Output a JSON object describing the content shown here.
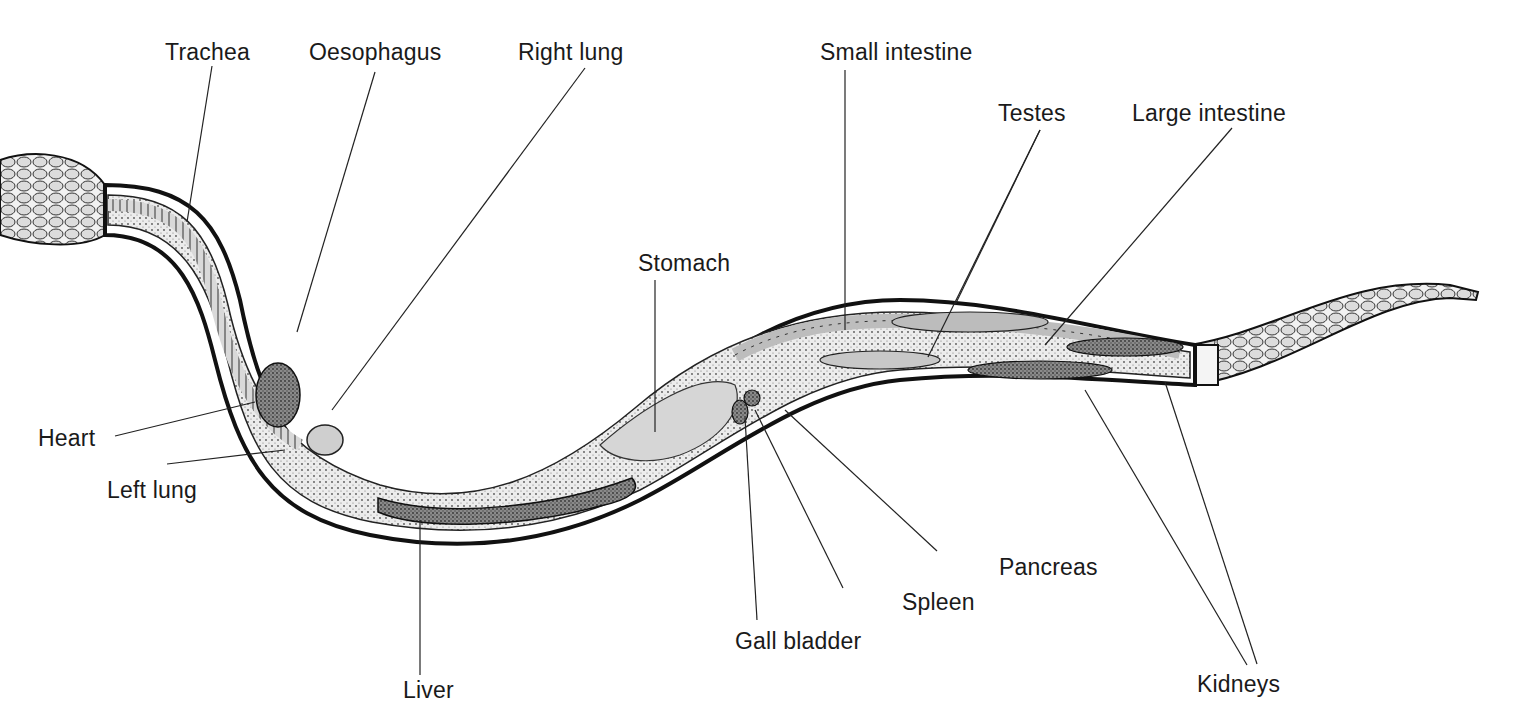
{
  "diagram": {
    "colors": {
      "outline": "#111111",
      "body_fill": "#e6e6e6",
      "organ_dark": "#6e6e6e",
      "organ_mid": "#b5b5b5",
      "leader": "#222222"
    },
    "labels": [
      {
        "id": "trachea",
        "text": "Trachea",
        "x": 165,
        "y": 41,
        "line": [
          212,
          66,
          187,
          222
        ]
      },
      {
        "id": "oesophagus",
        "text": "Oesophagus",
        "x": 309,
        "y": 41,
        "line": [
          375,
          72,
          297,
          332
        ]
      },
      {
        "id": "right-lung",
        "text": "Right lung",
        "x": 518,
        "y": 41,
        "line": [
          585,
          68,
          332,
          410
        ]
      },
      {
        "id": "small-intestine",
        "text": "Small intestine",
        "x": 820,
        "y": 41,
        "line": [
          845,
          70,
          845,
          330
        ]
      },
      {
        "id": "testes",
        "text": "Testes",
        "x": 998,
        "y": 102,
        "line": [
          1040,
          130,
          928,
          357
        ],
        "line2": [
          1040,
          130,
          955,
          305
        ]
      },
      {
        "id": "large-intestine",
        "text": "Large intestine",
        "x": 1132,
        "y": 102,
        "line": [
          1232,
          128,
          1045,
          345
        ]
      },
      {
        "id": "stomach",
        "text": "Stomach",
        "x": 638,
        "y": 252,
        "line": [
          655,
          280,
          655,
          432
        ]
      },
      {
        "id": "heart",
        "text": "Heart",
        "x": 38,
        "y": 427,
        "line": [
          115,
          436,
          255,
          402
        ]
      },
      {
        "id": "left-lung",
        "text": "Left lung",
        "x": 107,
        "y": 479,
        "line": [
          167,
          464,
          285,
          450
        ]
      },
      {
        "id": "liver",
        "text": "Liver",
        "x": 403,
        "y": 679,
        "line": [
          420,
          675,
          420,
          520
        ]
      },
      {
        "id": "gall-bladder",
        "text": "Gall bladder",
        "x": 735,
        "y": 630,
        "line": [
          757,
          620,
          745,
          418
        ]
      },
      {
        "id": "spleen",
        "text": "Spleen",
        "x": 902,
        "y": 591,
        "line": [
          843,
          588,
          755,
          410
        ]
      },
      {
        "id": "pancreas",
        "text": "Pancreas",
        "x": 999,
        "y": 556,
        "line": [
          937,
          551,
          785,
          410
        ]
      },
      {
        "id": "kidneys",
        "text": "Kidneys",
        "x": 1197,
        "y": 673,
        "line": [
          1247,
          665,
          1085,
          390
        ],
        "line2": [
          1257,
          664,
          1165,
          382
        ]
      }
    ]
  }
}
